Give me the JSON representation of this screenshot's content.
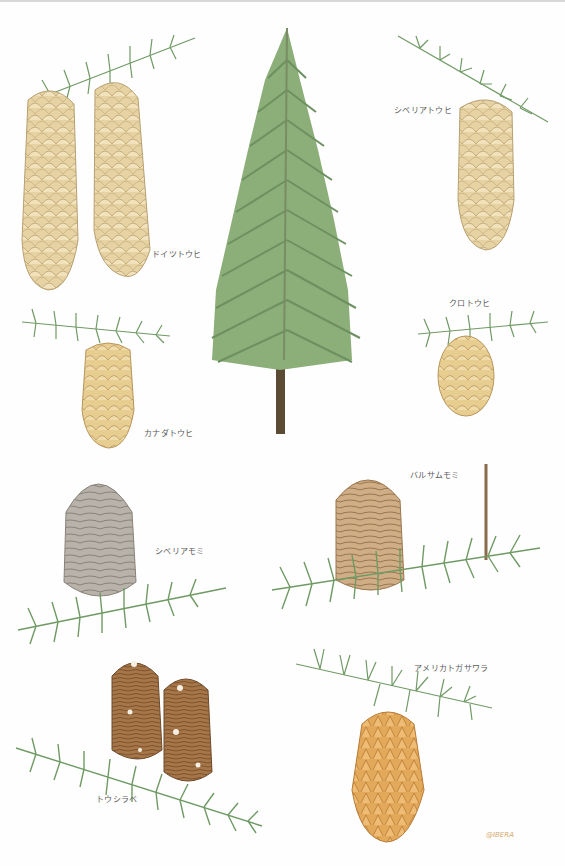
{
  "plate": {
    "background": "#fefefe",
    "center_tree": {
      "description": "spruce tree illustration",
      "foliage_color": "#7ea06a",
      "trunk_color": "#5b4a34"
    },
    "specimens": [
      {
        "id": "norway-spruce",
        "label": "ドイツトウヒ",
        "cone_color": "#e6d2a2",
        "count": 2
      },
      {
        "id": "siberian-spruce",
        "label": "シベリアトウヒ",
        "cone_color": "#ecd7a5",
        "count": 1
      },
      {
        "id": "black-spruce",
        "label": "クロトウヒ",
        "cone_color": "#e9cf92",
        "count": 1
      },
      {
        "id": "white-spruce",
        "label": "カナダトウヒ",
        "cone_color": "#e8cd90",
        "count": 1
      },
      {
        "id": "balsam-fir",
        "label": "バルサムモミ",
        "cone_color": "#c9a67c",
        "count": 1
      },
      {
        "id": "siberian-fir",
        "label": "シベリアモミ",
        "cone_color": "#b3aea5",
        "count": 1
      },
      {
        "id": "douglas-fir",
        "label": "アメリカトガサワラ",
        "cone_color": "#e3a95a",
        "count": 1
      },
      {
        "id": "veitch-fir",
        "label": "トウシラベ",
        "cone_color": "#9e6e42",
        "count": 2
      }
    ],
    "signature": "@IBERA",
    "needle_color": "#6f9a64"
  }
}
